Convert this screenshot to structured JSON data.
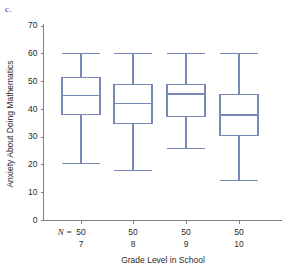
{
  "panel": {
    "label": "c."
  },
  "chart_data": {
    "type": "box",
    "title": "",
    "xlabel": "Grade Level in School",
    "ylabel": "Anxiety About Doing Mathematics",
    "ylim": [
      0,
      70
    ],
    "yticks": [
      0,
      10,
      20,
      30,
      40,
      50,
      60,
      70
    ],
    "ytick_labels": [
      "0",
      "10",
      "20",
      "30",
      "40",
      "50",
      "60",
      "70"
    ],
    "grid": false,
    "legend": "none",
    "n_row_label": "N =",
    "categories": [
      "7",
      "8",
      "9",
      "10"
    ],
    "n_values": [
      "50",
      "50",
      "50",
      "50"
    ],
    "boxes": [
      {
        "category": "7",
        "n": "50",
        "whisker_low": 20.5,
        "q1": 38.0,
        "median": 45.0,
        "q3": 51.5,
        "whisker_high": 60.0
      },
      {
        "category": "8",
        "n": "50",
        "whisker_low": 18.0,
        "q1": 35.0,
        "median": 42.0,
        "q3": 49.0,
        "whisker_high": 60.0
      },
      {
        "category": "9",
        "n": "50",
        "whisker_low": 26.0,
        "q1": 37.5,
        "median": 45.5,
        "q3": 49.0,
        "whisker_high": 60.0
      },
      {
        "category": "10",
        "n": "50",
        "whisker_low": 14.5,
        "q1": 30.5,
        "median": 38.0,
        "q3": 45.5,
        "whisker_high": 60.0
      }
    ],
    "colors": {
      "box_stroke": "#7a88b8",
      "axis": "#808080",
      "text": "#2b2b2b",
      "background": "#ffffff"
    }
  }
}
